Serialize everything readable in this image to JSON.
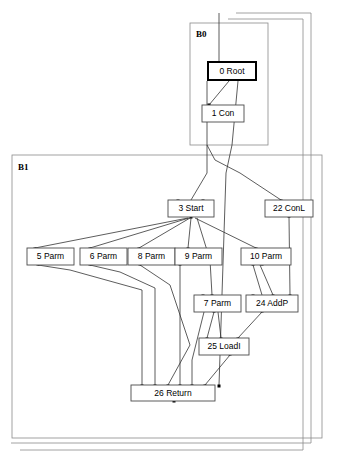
{
  "figure": {
    "type": "compiler-ideal-graph",
    "width": 357,
    "height": 458,
    "background": "#ffffff",
    "edge_color": "#333333",
    "region_border_color": "#8a8a8a",
    "node_border_color": "#4a4a4a",
    "root_border_color": "#000000"
  },
  "regions": [
    {
      "id": "B0",
      "label": "B0",
      "x": 190,
      "y": 23,
      "w": 78,
      "h": 122,
      "label_x": 196,
      "label_y": 37
    },
    {
      "id": "B1",
      "label": "B1",
      "x": 12,
      "y": 155,
      "w": 310,
      "h": 283,
      "label_x": 18,
      "label_y": 170
    }
  ],
  "outer_frames": [
    {
      "id": "frame-outer-1",
      "points": "236,13 311,13 311,443 11,443"
    },
    {
      "id": "frame-outer-2",
      "points": "228,19 303,19 303,450 20,450"
    }
  ],
  "nodes": [
    {
      "id": "n0",
      "label": "0 Root",
      "x": 208,
      "y": 62,
      "w": 48,
      "h": 18,
      "style": "root"
    },
    {
      "id": "n1",
      "label": "1 Con",
      "x": 202,
      "y": 105,
      "w": 42,
      "h": 17,
      "style": "normal"
    },
    {
      "id": "n3",
      "label": "3 Start",
      "x": 168,
      "y": 200,
      "w": 46,
      "h": 17,
      "style": "normal"
    },
    {
      "id": "n22",
      "label": "22 ConL",
      "x": 265,
      "y": 200,
      "w": 48,
      "h": 17,
      "style": "normal"
    },
    {
      "id": "n5",
      "label": "5 Parm",
      "x": 27,
      "y": 248,
      "w": 47,
      "h": 17,
      "style": "normal"
    },
    {
      "id": "n6",
      "label": "6 Parm",
      "x": 80,
      "y": 248,
      "w": 47,
      "h": 17,
      "style": "normal"
    },
    {
      "id": "n8",
      "label": "8 Parm",
      "x": 128,
      "y": 248,
      "w": 47,
      "h": 17,
      "style": "normal"
    },
    {
      "id": "n9",
      "label": "9 Parm",
      "x": 175,
      "y": 248,
      "w": 47,
      "h": 17,
      "style": "normal"
    },
    {
      "id": "n10",
      "label": "10 Parm",
      "x": 241,
      "y": 248,
      "w": 50,
      "h": 17,
      "style": "normal"
    },
    {
      "id": "n7",
      "label": "7 Parm",
      "x": 194,
      "y": 295,
      "w": 47,
      "h": 17,
      "style": "normal"
    },
    {
      "id": "n24",
      "label": "24 AddP",
      "x": 246,
      "y": 295,
      "w": 52,
      "h": 17,
      "style": "normal"
    },
    {
      "id": "n25",
      "label": "25 LoadI",
      "x": 199,
      "y": 338,
      "w": 50,
      "h": 17,
      "style": "normal"
    },
    {
      "id": "n26",
      "label": "26 Return",
      "x": 131,
      "y": 385,
      "w": 84,
      "h": 16,
      "style": "normal"
    }
  ],
  "edges": [
    {
      "from": "n1",
      "to": "n0",
      "path": "M 209,105 L 229,81"
    },
    {
      "from": "n26",
      "to": "n0",
      "path": "M 238,81 L 232,145 L 226,173 L 219,385"
    },
    {
      "from": "frame",
      "to": "n0",
      "path": "M 219,13 L 219,62"
    },
    {
      "from": "n3",
      "to": "root-chain",
      "path": "M 191,200 L 207,173 L 207,145 L 207,81"
    },
    {
      "from": "n22",
      "to": "root-chain",
      "path": "M 281,200 L 240,173 L 215,160 L 207,145"
    },
    {
      "from": "n5",
      "to": "n3",
      "path": "M 35,248 L 188,218"
    },
    {
      "from": "n6",
      "to": "n3",
      "path": "M 90,248 L 189,218"
    },
    {
      "from": "n8",
      "to": "n3",
      "path": "M 139,248 L 190,218"
    },
    {
      "from": "n9",
      "to": "n3",
      "path": "M 188,248 L 191,218"
    },
    {
      "from": "n10",
      "to": "n3",
      "path": "M 256,248 L 195,218"
    },
    {
      "from": "n7",
      "to": "n3",
      "path": "M 212,295 L 210,260 L 197,218"
    },
    {
      "from": "n24",
      "to": "n10",
      "path": "M 262,295 L 253,265"
    },
    {
      "from": "n24",
      "to": "n10b",
      "path": "M 273,295 L 260,265"
    },
    {
      "from": "n24",
      "to": "n22",
      "path": "M 290,295 L 289,217"
    },
    {
      "from": "n25",
      "to": "n7",
      "path": "M 207,338 L 214,312"
    },
    {
      "from": "n25",
      "to": "n7b",
      "path": "M 221,338 L 218,312"
    },
    {
      "from": "n25",
      "to": "n24",
      "path": "M 238,338 L 262,312"
    },
    {
      "from": "n26",
      "to": "n5",
      "path": "M 142,385 L 142,290 L 70,270 L 38,265"
    },
    {
      "from": "n26",
      "to": "n6",
      "path": "M 155,385 L 155,288 L 120,272 L 90,265"
    },
    {
      "from": "n26",
      "to": "n8",
      "path": "M 168,385 L 190,345 L 170,285 L 140,265"
    },
    {
      "from": "n26",
      "to": "n9",
      "path": "M 180,385 L 180,265"
    },
    {
      "from": "n26",
      "to": "n7",
      "path": "M 192,385 L 192,360 L 204,312"
    },
    {
      "from": "n26",
      "to": "n25",
      "path": "M 205,385 L 230,355"
    }
  ],
  "ports": [
    {
      "x": 219,
      "y": 63
    },
    {
      "x": 232,
      "y": 63
    },
    {
      "x": 229,
      "y": 79
    },
    {
      "x": 209,
      "y": 105
    },
    {
      "x": 178,
      "y": 201
    },
    {
      "x": 203,
      "y": 201
    },
    {
      "x": 191,
      "y": 217
    },
    {
      "x": 281,
      "y": 201
    },
    {
      "x": 289,
      "y": 216
    },
    {
      "x": 35,
      "y": 249
    },
    {
      "x": 38,
      "y": 264
    },
    {
      "x": 90,
      "y": 249
    },
    {
      "x": 90,
      "y": 264
    },
    {
      "x": 139,
      "y": 249
    },
    {
      "x": 140,
      "y": 264
    },
    {
      "x": 188,
      "y": 249
    },
    {
      "x": 180,
      "y": 264
    },
    {
      "x": 256,
      "y": 249
    },
    {
      "x": 253,
      "y": 264
    },
    {
      "x": 262,
      "y": 264
    },
    {
      "x": 203,
      "y": 296
    },
    {
      "x": 212,
      "y": 296
    },
    {
      "x": 214,
      "y": 311
    },
    {
      "x": 253,
      "y": 296
    },
    {
      "x": 273,
      "y": 296
    },
    {
      "x": 290,
      "y": 296
    },
    {
      "x": 262,
      "y": 311
    },
    {
      "x": 207,
      "y": 339
    },
    {
      "x": 221,
      "y": 339
    },
    {
      "x": 238,
      "y": 339
    },
    {
      "x": 230,
      "y": 354
    },
    {
      "x": 142,
      "y": 386
    },
    {
      "x": 155,
      "y": 386
    },
    {
      "x": 168,
      "y": 386
    },
    {
      "x": 180,
      "y": 386
    },
    {
      "x": 192,
      "y": 386
    },
    {
      "x": 205,
      "y": 386
    },
    {
      "x": 219,
      "y": 386
    },
    {
      "x": 174,
      "y": 401
    }
  ]
}
